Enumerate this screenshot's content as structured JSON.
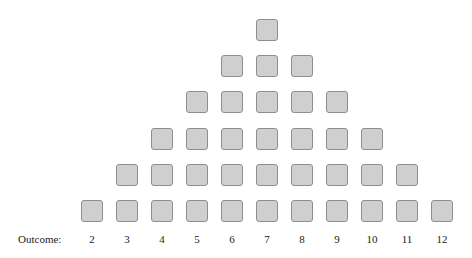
{
  "diagram": {
    "row_label": "Outcome:",
    "box_fill": "#cfcfcf",
    "box_border": "#8e8e8e",
    "outcomes": [
      {
        "label": "2",
        "count": 1
      },
      {
        "label": "3",
        "count": 2
      },
      {
        "label": "4",
        "count": 3
      },
      {
        "label": "5",
        "count": 4
      },
      {
        "label": "6",
        "count": 5
      },
      {
        "label": "7",
        "count": 6
      },
      {
        "label": "8",
        "count": 5
      },
      {
        "label": "9",
        "count": 4
      },
      {
        "label": "10",
        "count": 3
      },
      {
        "label": "11",
        "count": 2
      },
      {
        "label": "12",
        "count": 1
      }
    ]
  }
}
